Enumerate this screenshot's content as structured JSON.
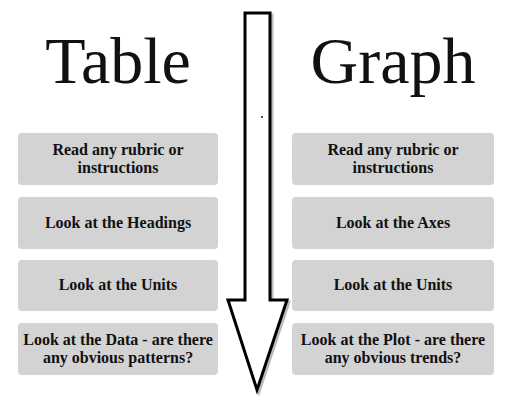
{
  "diagram": {
    "left_column": {
      "title": "Table",
      "steps": [
        "Read any rubric or instructions",
        "Look at the Headings",
        "Look at the Units",
        "Look at the Data - are there any obvious patterns?"
      ]
    },
    "right_column": {
      "title": "Graph",
      "steps": [
        "Read any rubric or instructions",
        "Look at the Axes",
        "Look at the Units",
        "Look at the Plot - are there any obvious trends?"
      ]
    },
    "arrow": {
      "direction": "down",
      "icon": "down-arrow-icon"
    },
    "colors": {
      "box_fill": "#d3d3d3",
      "text": "#111111",
      "arrow_stroke": "#000000",
      "background": "#ffffff"
    }
  }
}
